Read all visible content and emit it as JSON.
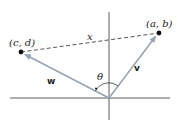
{
  "diagram": {
    "title": "",
    "points": [
      {
        "id": "ab",
        "label": "(a, b)"
      },
      {
        "id": "cd",
        "label": "(c, d)"
      }
    ],
    "vectors": [
      {
        "id": "v",
        "label": "v",
        "to": "ab"
      },
      {
        "id": "w",
        "label": "w",
        "to": "cd"
      }
    ],
    "segment": {
      "label": "x",
      "style": "dashed"
    },
    "angle": {
      "label": "θ"
    },
    "colors": {
      "vector": "#9aa4b0",
      "axis": "#4a4a4a",
      "point": "#111111",
      "dash": "#555555"
    }
  }
}
